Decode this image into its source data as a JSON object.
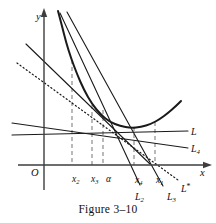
{
  "figure": {
    "caption": "Figure 3–10",
    "axes": {
      "x_label": "x",
      "y_label": "y",
      "origin_label": "O"
    },
    "tick_labels": [
      {
        "id": "x2",
        "text": "x₂",
        "x": 72,
        "y": 175
      },
      {
        "id": "x3",
        "text": "x₃",
        "x": 91,
        "y": 175
      },
      {
        "id": "alpha",
        "text": "α",
        "x": 106,
        "y": 175
      },
      {
        "id": "x4",
        "text": "x₄",
        "x": 135,
        "y": 176
      },
      {
        "id": "x1",
        "text": "x₁",
        "x": 156,
        "y": 176
      }
    ],
    "curve_labels": [
      {
        "id": "L",
        "text": "L",
        "x": 191,
        "y": 127
      },
      {
        "id": "L4",
        "text": "L₄",
        "x": 191,
        "y": 144
      },
      {
        "id": "Lstar",
        "text": "L*",
        "x": 181,
        "y": 183
      },
      {
        "id": "L2",
        "text": "L₂",
        "x": 135,
        "y": 192
      },
      {
        "id": "L3",
        "text": "L₃",
        "x": 167,
        "y": 192
      }
    ],
    "colors": {
      "ink": "#1a1a1a",
      "axis": "#3d3d3d",
      "guide": "#8c8c8c",
      "background": "#ffffff"
    }
  },
  "chart_data": {
    "type": "line",
    "title": "Figure 3–10",
    "xlabel": "x",
    "ylabel": "y",
    "grid": false,
    "legend": "inline-annotations",
    "axis_geometry": {
      "x_axis_y": 165,
      "y_axis_x": 44,
      "x_axis_arrow_x": 206,
      "y_axis_arrow_y": 14
    },
    "root_point": {
      "label": "α",
      "px": 103,
      "py": 118
    },
    "curve": {
      "name": "f(x)",
      "style": "solid-thick",
      "points": [
        [
          58,
          11
        ],
        [
          62,
          26
        ],
        [
          66,
          42
        ],
        [
          71,
          58
        ],
        [
          77,
          74
        ],
        [
          84,
          90
        ],
        [
          92,
          104
        ],
        [
          101,
          115
        ],
        [
          110,
          122
        ],
        [
          120,
          126
        ],
        [
          131,
          128
        ],
        [
          141,
          127
        ],
        [
          151,
          124
        ],
        [
          160,
          119
        ],
        [
          168,
          113
        ],
        [
          176,
          106
        ],
        [
          181,
          101
        ]
      ]
    },
    "lines": [
      {
        "id": "L",
        "label": "L",
        "style": "solid-thin",
        "points": [
          [
            12,
            135
          ],
          [
            188,
            131
          ]
        ],
        "note": "shallowest line, nearly horizontal, labelled L at right"
      },
      {
        "id": "L4",
        "label": "L₄",
        "style": "solid-thin",
        "points": [
          [
            12,
            123
          ],
          [
            188,
            148
          ]
        ],
        "note": "second shallow line labelled L4 at right"
      },
      {
        "id": "Lsecant1",
        "label": "",
        "style": "solid-thin",
        "points": [
          [
            26,
            44
          ],
          [
            150,
            164
          ]
        ],
        "note": "steep secant through alpha from upper-left"
      },
      {
        "id": "L2",
        "label": "L₂",
        "style": "solid-thin",
        "points": [
          [
            60,
            13
          ],
          [
            140,
            185
          ]
        ],
        "note": "steep line ending at label L2 below axis"
      },
      {
        "id": "L3",
        "label": "L₃",
        "style": "solid-thin",
        "points": [
          [
            67,
            12
          ],
          [
            163,
            186
          ]
        ],
        "note": "steep line ending at label L3 below axis"
      },
      {
        "id": "Lstar",
        "label": "L*",
        "style": "dotted",
        "points": [
          [
            17,
            63
          ],
          [
            178,
            180
          ]
        ],
        "note": "dotted limiting line L*"
      }
    ],
    "guides": [
      {
        "id": "guide-x2",
        "x": 72,
        "from_y": 60,
        "to_y": 165,
        "style": "dashed"
      },
      {
        "id": "guide-x3",
        "x": 92,
        "from_y": 105,
        "to_y": 165,
        "style": "dashed"
      },
      {
        "id": "guide-alpha",
        "x": 103,
        "from_y": 110,
        "to_y": 165,
        "style": "dashed"
      },
      {
        "id": "guide-x4",
        "x": 134,
        "from_y": 127,
        "to_y": 165,
        "style": "dashed"
      },
      {
        "id": "guide-x1",
        "x": 155,
        "from_y": 122,
        "to_y": 165,
        "style": "dashed"
      }
    ]
  }
}
